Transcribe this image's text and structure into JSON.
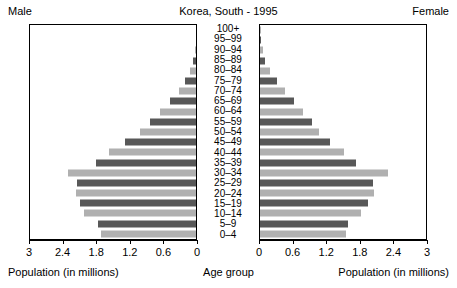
{
  "header": {
    "male_label": "Male",
    "female_label": "Female",
    "title": "Korea, South - 1995"
  },
  "footers": {
    "male_axis_caption": "Population (in millions)",
    "female_axis_caption": "Population (in millions)",
    "center_caption": "Age group"
  },
  "style": {
    "bar_dark": "#585858",
    "bar_light": "#b0b0b0",
    "frame": "#000000",
    "background": "#ffffff"
  },
  "chart_data": {
    "type": "bar",
    "title": "Korea, South - 1995",
    "subtitle": "",
    "orientation": "horizontal-pyramid",
    "xlabel": "Population (in millions)",
    "ylabel": "Age group",
    "grid": false,
    "legend_position": "none",
    "left_panel_name": "Male",
    "right_panel_name": "Female",
    "xlim_left": [
      3,
      0
    ],
    "xlim_right": [
      0,
      3
    ],
    "tick_values_left": [
      "3",
      "2.4",
      "1.8",
      "1.2",
      "0.6",
      "0"
    ],
    "tick_values_right": [
      "0",
      "0.6",
      "1.2",
      "1.8",
      "2.4",
      "3"
    ],
    "tick_numeric": [
      3,
      2.4,
      1.8,
      1.2,
      0.6,
      0
    ],
    "axis_max": 3,
    "categories": [
      "100+",
      "95–99",
      "90–94",
      "85–89",
      "80–84",
      "75–79",
      "70–74",
      "65–69",
      "60–64",
      "55–59",
      "50–54",
      "45–49",
      "40–44",
      "35–39",
      "30–34",
      "25–29",
      "20–24",
      "15–19",
      "10–14",
      "5–9",
      "0–4"
    ],
    "series": [
      {
        "name": "Male",
        "values": [
          0.002,
          0.008,
          0.022,
          0.055,
          0.115,
          0.2,
          0.31,
          0.46,
          0.64,
          0.83,
          1.0,
          1.26,
          1.55,
          1.78,
          2.28,
          2.13,
          2.15,
          2.08,
          2.0,
          1.75,
          1.7
        ]
      },
      {
        "name": "Female",
        "values": [
          0.004,
          0.016,
          0.045,
          0.098,
          0.185,
          0.3,
          0.44,
          0.6,
          0.77,
          0.92,
          1.05,
          1.25,
          1.5,
          1.72,
          2.28,
          2.02,
          2.03,
          1.92,
          1.8,
          1.58,
          1.53
        ]
      }
    ]
  }
}
